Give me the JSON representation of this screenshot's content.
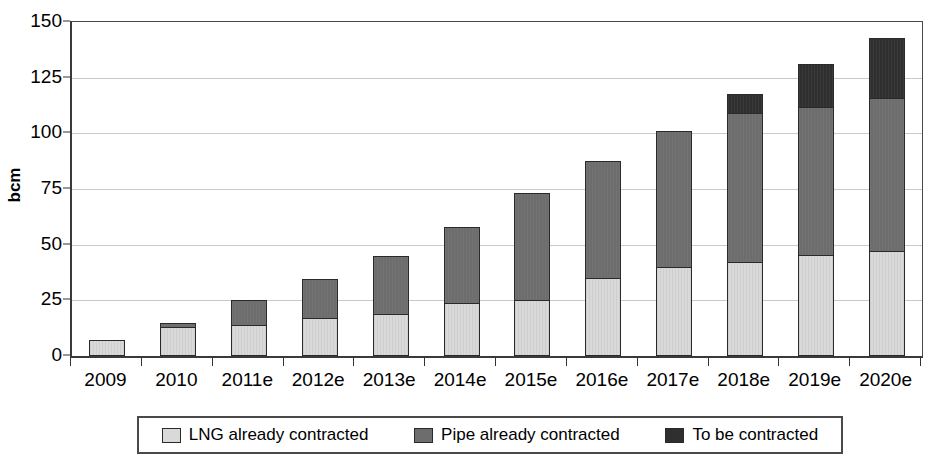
{
  "chart_data": {
    "type": "bar",
    "stacked": true,
    "title": "",
    "xlabel": "",
    "ylabel": "bcm",
    "ylim": [
      0,
      150
    ],
    "yticks": [
      0,
      25,
      50,
      75,
      100,
      125,
      150
    ],
    "grid": true,
    "legend_position": "bottom",
    "categories": [
      "2009",
      "2010",
      "2011e",
      "2012e",
      "2013e",
      "2014e",
      "2015e",
      "2016e",
      "2017e",
      "2018e",
      "2019e",
      "2020e"
    ],
    "series": [
      {
        "name": "LNG already contracted",
        "color": "#d9d9d9",
        "values": [
          7,
          13,
          14,
          17,
          19,
          24,
          25,
          35,
          40,
          42,
          45.5,
          47
        ]
      },
      {
        "name": "Pipe already contracted",
        "color": "#6d6d6d",
        "values": [
          0,
          2,
          11,
          17.5,
          26,
          34,
          48,
          52.5,
          61,
          67,
          66.5,
          69
        ]
      },
      {
        "name": "To be contracted",
        "color": "#2f2f2f",
        "values": [
          0,
          0,
          0,
          0,
          0,
          0,
          0,
          0,
          0,
          8.5,
          19,
          27
        ]
      }
    ],
    "totals": [
      7,
      15,
      25,
      34.5,
      45,
      58,
      73,
      87.5,
      101,
      117.5,
      131,
      143
    ]
  },
  "axis": {
    "y_title": "bcm",
    "y_tick_labels": [
      "0",
      "25",
      "50",
      "75",
      "100",
      "125",
      "150"
    ],
    "x_tick_labels": [
      "2009",
      "2010",
      "2011e",
      "2012e",
      "2013e",
      "2014e",
      "2015e",
      "2016e",
      "2017e",
      "2018e",
      "2019e",
      "2020e"
    ]
  },
  "legend": {
    "items": [
      {
        "label": "LNG already contracted",
        "color": "#d9d9d9"
      },
      {
        "label": "Pipe already contracted",
        "color": "#6d6d6d"
      },
      {
        "label": "To be contracted",
        "color": "#2f2f2f"
      }
    ]
  }
}
